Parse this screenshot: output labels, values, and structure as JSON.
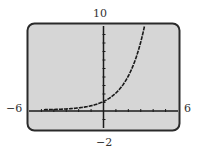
{
  "chart_data": {
    "type": "line",
    "title": "",
    "xlabel": "",
    "ylabel": "",
    "xlim": [
      -6,
      6
    ],
    "ylim": [
      -2,
      10
    ],
    "x_ticks_step": 1,
    "y_ticks_step": 1,
    "grid": false,
    "legend": "none",
    "series": [
      {
        "name": "exponential curve (approx. y = 2^x)",
        "function": "2^x",
        "x": [
          -6,
          -5,
          -4,
          -3,
          -2,
          -1,
          0,
          1,
          2,
          3,
          3.32
        ],
        "values": [
          0.016,
          0.031,
          0.063,
          0.125,
          0.25,
          0.5,
          1,
          2,
          4,
          8,
          10
        ]
      }
    ]
  },
  "labels": {
    "xmin": "−6",
    "xmax": "6",
    "ymin": "−2",
    "ymax": "10"
  },
  "colors": {
    "screen_bg": "#d6d6d6",
    "frame": "#2a2a2a",
    "axis": "#1a1a1a",
    "curve": "#1a1a1a",
    "label": "#333333"
  }
}
